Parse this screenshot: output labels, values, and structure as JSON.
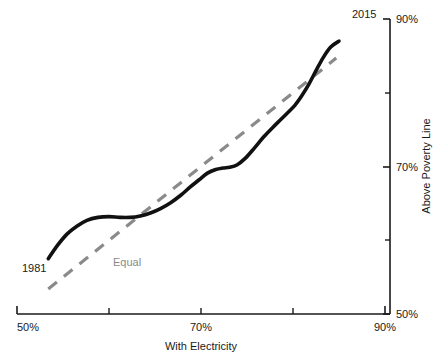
{
  "chart_data": {
    "type": "line",
    "title": "",
    "xlabel": "With Electricity",
    "ylabel": "Above Poverty Line",
    "xlim": [
      50,
      90
    ],
    "ylim": [
      50,
      90
    ],
    "grid": false,
    "legend_position": "inline-annotations",
    "x_ticks": [
      50,
      60,
      70,
      80,
      90
    ],
    "x_tick_labels": [
      "50%",
      "",
      "70%",
      "",
      "90%"
    ],
    "y_ticks": [
      50,
      60,
      70,
      80,
      90
    ],
    "y_tick_labels": [
      "50%",
      "",
      "70%",
      "",
      "90%"
    ],
    "y_axis_side": "right",
    "series": [
      {
        "name": "trajectory",
        "color": "#111111",
        "style": "solid",
        "start_label": "1981",
        "end_label": "2015",
        "x": [
          53.4,
          54.4,
          55.4,
          56.5,
          57.6,
          58.8,
          60.0,
          61.2,
          62.3,
          63.4,
          64.5,
          65.6,
          66.7,
          67.8,
          68.8,
          69.8,
          70.7,
          71.6,
          72.4,
          73.1,
          73.9,
          74.8,
          75.8,
          76.8,
          77.8,
          78.7,
          79.5,
          80.2,
          80.9,
          81.7,
          82.5,
          83.3,
          84.1,
          85.0
        ],
        "y": [
          57.5,
          59.3,
          60.8,
          61.9,
          62.7,
          63.1,
          63.2,
          63.1,
          63.1,
          63.3,
          63.7,
          64.3,
          65.1,
          66.1,
          67.2,
          68.2,
          69.1,
          69.6,
          69.8,
          69.9,
          70.2,
          71.1,
          72.5,
          74.0,
          75.3,
          76.4,
          77.4,
          78.3,
          79.5,
          81.1,
          83.0,
          84.8,
          86.2,
          87.0
        ]
      },
      {
        "name": "Equal",
        "label": "Equal",
        "color": "#8a8a8a",
        "style": "dashed",
        "x": [
          53.4,
          84.7
        ],
        "y": [
          53.4,
          84.7
        ]
      }
    ]
  },
  "labels": {
    "x_axis_title": "With Electricity",
    "y_axis_title": "Above Poverty Line",
    "x_tick_50": "50%",
    "x_tick_70": "70%",
    "x_tick_90": "90%",
    "y_tick_50": "50%",
    "y_tick_70": "70%",
    "y_tick_90": "90%",
    "start_year": "1981",
    "end_year": "2015",
    "equal_line": "Equal"
  },
  "colors": {
    "line": "#111111",
    "reference": "#8a8a8a",
    "axis": "#1a1a1a",
    "background": "#ffffff"
  }
}
